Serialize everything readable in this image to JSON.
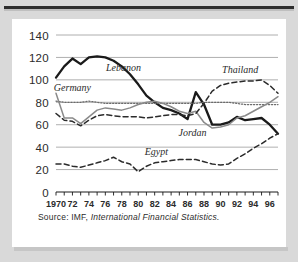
{
  "figure": {
    "source_prefix": "Source:  IMF,",
    "source_italic": "International Financial Statistics."
  },
  "colors": {
    "page_background": "#d9d9d9",
    "card_background": "#ffffff",
    "rule": "#2e2e2e",
    "gridline": "#9a9a9a",
    "axis": "#1a1a1a",
    "lebanon": "#1a1a1a",
    "jordan": "#8a8a8a",
    "germany": "#6b6b6b",
    "thailand": "#2b2b2b",
    "egypt": "#2b2b2b",
    "text": "#2b2b2b"
  },
  "chart_data": {
    "type": "line",
    "title": "",
    "xlabel": "",
    "ylabel": "",
    "xlim": [
      1970,
      1997
    ],
    "ylim": [
      0,
      140
    ],
    "yticks": [
      0,
      20,
      40,
      60,
      80,
      100,
      120,
      140
    ],
    "ytick_labels": [
      "0",
      "20",
      "40",
      "60",
      "80",
      "100",
      "120",
      "140"
    ],
    "xtick_labels": [
      "1970",
      "72",
      "74",
      "76",
      "78",
      "80",
      "82",
      "84",
      "86",
      "88",
      "90",
      "92",
      "94",
      "96"
    ],
    "xtick_values": [
      1970,
      1972,
      1974,
      1976,
      1978,
      1980,
      1982,
      1984,
      1986,
      1988,
      1990,
      1992,
      1994,
      1996
    ],
    "minor_tick_step": 1,
    "grid": "horizontal",
    "legend": "inline-annotations",
    "x": [
      1970,
      1971,
      1972,
      1973,
      1974,
      1975,
      1976,
      1977,
      1978,
      1979,
      1980,
      1981,
      1982,
      1983,
      1984,
      1985,
      1986,
      1987,
      1988,
      1989,
      1990,
      1991,
      1992,
      1993,
      1994,
      1995,
      1996,
      1997
    ],
    "series": [
      {
        "name": "Lebanon",
        "style": "solid-thick",
        "color": "#1a1a1a",
        "label_x": 1978.2,
        "label_y": 108,
        "values": [
          102,
          112,
          119,
          114,
          120,
          121,
          120,
          117,
          112,
          105,
          96,
          86,
          80,
          75,
          73,
          70,
          65,
          89,
          78,
          60,
          60,
          62,
          67,
          64,
          65,
          66,
          60,
          52
        ]
      },
      {
        "name": "Germany",
        "style": "dotted",
        "color": "#6b6b6b",
        "label_x": 1972.0,
        "label_y": 90,
        "values": [
          81,
          80,
          80,
          80,
          81,
          80,
          79,
          79,
          79,
          79,
          79,
          79,
          79,
          79,
          79,
          79,
          79,
          79,
          80,
          80,
          80,
          80,
          79,
          78,
          78,
          78,
          78,
          78
        ]
      },
      {
        "name": "Jordan",
        "style": "solid-gray",
        "color": "#8a8a8a",
        "label_x": 1986.6,
        "label_y": 50,
        "values": [
          88,
          66,
          66,
          61,
          67,
          73,
          75,
          74,
          73,
          75,
          78,
          80,
          81,
          79,
          76,
          72,
          70,
          72,
          62,
          57,
          58,
          60,
          66,
          68,
          72,
          76,
          80,
          85
        ]
      },
      {
        "name": "Thailand",
        "style": "dashed",
        "color": "#2b2b2b",
        "label_x": 1992.4,
        "label_y": 106,
        "values": [
          70,
          64,
          63,
          59,
          64,
          68,
          69,
          68,
          67,
          67,
          67,
          66,
          67,
          68,
          69,
          69,
          68,
          70,
          79,
          90,
          95,
          97,
          98,
          99,
          99,
          100,
          95,
          88
        ]
      },
      {
        "name": "Egypt",
        "style": "dashed",
        "color": "#2b2b2b",
        "label_x": 1982.2,
        "label_y": 33,
        "values": [
          25,
          25,
          23,
          22,
          24,
          26,
          28,
          31,
          27,
          25,
          18,
          23,
          26,
          27,
          28,
          29,
          29,
          29,
          27,
          25,
          24,
          25,
          30,
          34,
          39,
          43,
          48,
          52
        ]
      }
    ]
  }
}
